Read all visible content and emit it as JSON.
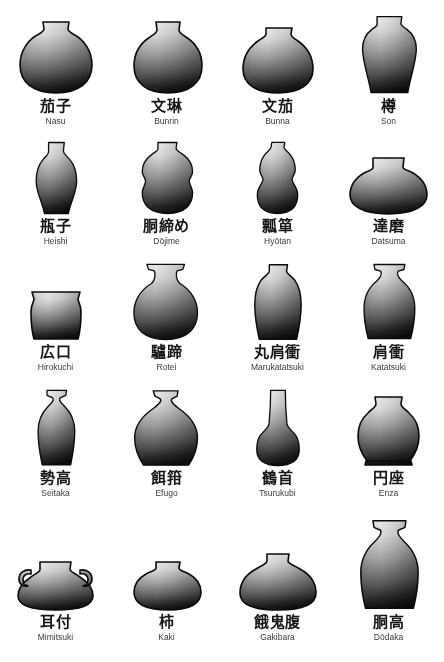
{
  "page": {
    "background_color": "#ffffff",
    "grid_rows": 5,
    "grid_columns": 4,
    "ink_color": "#161616",
    "romaji_color": "#3a3a3a",
    "gradient_light": "#f2f2f2",
    "gradient_mid": "#9a9a9a",
    "gradient_dark": "#111111"
  },
  "items": [
    {
      "kanji": "茄子",
      "romaji": "Nasu",
      "shape": "nasu",
      "row": 1,
      "col": 1
    },
    {
      "kanji": "文琳",
      "romaji": "Bunrin",
      "shape": "bunrin",
      "row": 1,
      "col": 2
    },
    {
      "kanji": "文茄",
      "romaji": "Bunna",
      "shape": "bunna",
      "row": 1,
      "col": 3
    },
    {
      "kanji": "樽",
      "romaji": "Son",
      "shape": "son",
      "row": 1,
      "col": 4
    },
    {
      "kanji": "瓶子",
      "romaji": "Heishi",
      "shape": "heishi",
      "row": 2,
      "col": 1
    },
    {
      "kanji": "胴締め",
      "romaji": "Dōjime",
      "shape": "dojime",
      "row": 2,
      "col": 2
    },
    {
      "kanji": "瓢箪",
      "romaji": "Hyōtan",
      "shape": "hyotan",
      "row": 2,
      "col": 3
    },
    {
      "kanji": "達磨",
      "romaji": "Datsuma",
      "shape": "datsuma",
      "row": 2,
      "col": 4
    },
    {
      "kanji": "広口",
      "romaji": "Hirokuchi",
      "shape": "hirokuchi",
      "row": 3,
      "col": 1
    },
    {
      "kanji": "驢蹄",
      "romaji": "Rotei",
      "shape": "rotei",
      "row": 3,
      "col": 2
    },
    {
      "kanji": "丸肩衝",
      "romaji": "Marukatatsuki",
      "shape": "marukatatsuki",
      "row": 3,
      "col": 3
    },
    {
      "kanji": "肩衝",
      "romaji": "Katatsuki",
      "shape": "katatsuki",
      "row": 3,
      "col": 4
    },
    {
      "kanji": "勢高",
      "romaji": "Seitaka",
      "shape": "seitaka",
      "row": 4,
      "col": 1
    },
    {
      "kanji": "餌箝",
      "romaji": "Efugo",
      "shape": "efugo",
      "row": 4,
      "col": 2
    },
    {
      "kanji": "鶴首",
      "romaji": "Tsurukubi",
      "shape": "tsurukubi",
      "row": 4,
      "col": 3
    },
    {
      "kanji": "円座",
      "romaji": "Enza",
      "shape": "enza",
      "row": 4,
      "col": 4
    },
    {
      "kanji": "耳付",
      "romaji": "Mimitsuki",
      "shape": "mimitsuki",
      "row": 5,
      "col": 1
    },
    {
      "kanji": "柿",
      "romaji": "Kaki",
      "shape": "kaki",
      "row": 5,
      "col": 2
    },
    {
      "kanji": "餓鬼腹",
      "romaji": "Gakibara",
      "shape": "gakibara",
      "row": 5,
      "col": 3
    },
    {
      "kanji": "胴高",
      "romaji": "Dōdaka",
      "shape": "dodaka",
      "row": 5,
      "col": 4
    }
  ]
}
